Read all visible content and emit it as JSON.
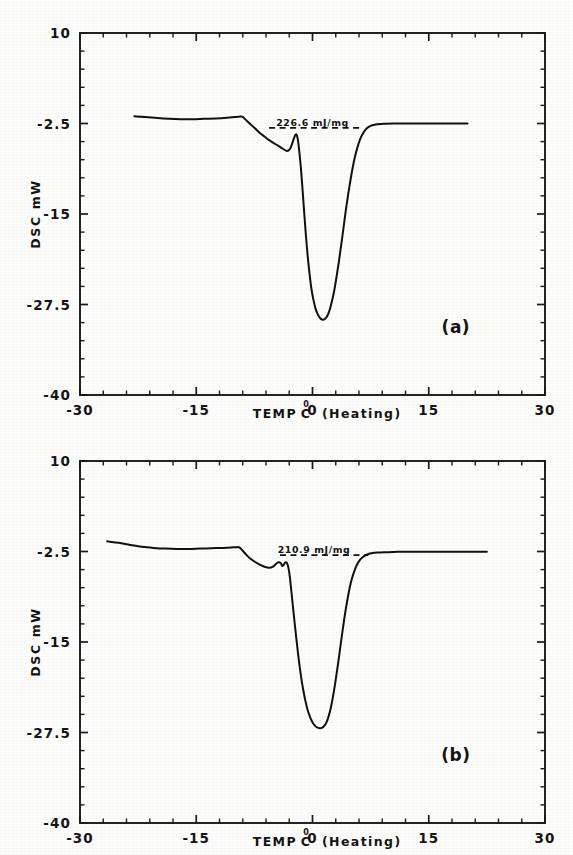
{
  "figure": {
    "background_color": "#fdfdfc",
    "ink_color": "#141414",
    "panel_count": 2
  },
  "chart_data": [
    {
      "type": "line",
      "panel_tag": "(a)",
      "title": "",
      "xlabel": "TEMP C  (Heating)",
      "xlabel_parts": {
        "prefix": "TEMP",
        "degree": "0",
        "unit": "C",
        "suffix": "(Heating)"
      },
      "ylabel": "DSC mW",
      "xlim": [
        -30,
        30
      ],
      "ylim": [
        -40,
        10
      ],
      "xticks": [
        -30,
        -15,
        0,
        15,
        30
      ],
      "xticklabels": [
        "-30",
        "-15",
        "0",
        "15",
        "30"
      ],
      "yticks": [
        10,
        -2.5,
        -15,
        -27.5,
        -40
      ],
      "yticklabels": [
        "10",
        "-2.5",
        "-15",
        "-27.5",
        "-40"
      ],
      "grid": false,
      "legend": "none",
      "annotations": [
        {
          "text": "226.6 mJ/mg",
          "kind": "enthalpy-label",
          "x": 0.0,
          "y": -2.9
        },
        {
          "text": "(a)",
          "kind": "panel-tag",
          "x": 18.5,
          "y": -31.5
        }
      ],
      "baseline": {
        "style": "dashed",
        "x_start": -5.6,
        "x_end": 6.4,
        "y": -3.1
      },
      "series": [
        {
          "name": "DSC heating scan (a)",
          "points": [
            [
              -23.0,
              -1.5
            ],
            [
              -21.5,
              -1.6
            ],
            [
              -20.0,
              -1.75
            ],
            [
              -18.5,
              -1.85
            ],
            [
              -17.0,
              -1.9
            ],
            [
              -15.5,
              -1.9
            ],
            [
              -14.0,
              -1.85
            ],
            [
              -12.5,
              -1.8
            ],
            [
              -11.0,
              -1.7
            ],
            [
              -10.0,
              -1.6
            ],
            [
              -9.3,
              -1.55
            ],
            [
              -9.0,
              -1.6
            ],
            [
              -8.6,
              -2.0
            ],
            [
              -8.0,
              -2.6
            ],
            [
              -7.4,
              -3.2
            ],
            [
              -6.8,
              -3.8
            ],
            [
              -6.2,
              -4.3
            ],
            [
              -5.6,
              -4.8
            ],
            [
              -5.0,
              -5.2
            ],
            [
              -4.4,
              -5.6
            ],
            [
              -3.8,
              -6.0
            ],
            [
              -3.3,
              -6.3
            ],
            [
              -2.9,
              -6.0
            ],
            [
              -2.6,
              -5.2
            ],
            [
              -2.35,
              -4.4
            ],
            [
              -2.15,
              -4.0
            ],
            [
              -2.0,
              -4.2
            ],
            [
              -1.85,
              -5.0
            ],
            [
              -1.7,
              -6.4
            ],
            [
              -1.5,
              -8.6
            ],
            [
              -1.3,
              -11.4
            ],
            [
              -1.1,
              -14.4
            ],
            [
              -0.9,
              -17.3
            ],
            [
              -0.7,
              -19.9
            ],
            [
              -0.5,
              -22.1
            ],
            [
              -0.3,
              -24.0
            ],
            [
              -0.1,
              -25.6
            ],
            [
              0.15,
              -27.0
            ],
            [
              0.4,
              -28.1
            ],
            [
              0.7,
              -28.9
            ],
            [
              1.0,
              -29.4
            ],
            [
              1.3,
              -29.6
            ],
            [
              1.6,
              -29.5
            ],
            [
              1.9,
              -29.1
            ],
            [
              2.2,
              -28.3
            ],
            [
              2.5,
              -27.1
            ],
            [
              2.8,
              -25.6
            ],
            [
              3.1,
              -23.7
            ],
            [
              3.4,
              -21.6
            ],
            [
              3.7,
              -19.3
            ],
            [
              4.0,
              -16.9
            ],
            [
              4.3,
              -14.5
            ],
            [
              4.6,
              -12.3
            ],
            [
              4.9,
              -10.3
            ],
            [
              5.2,
              -8.5
            ],
            [
              5.5,
              -7.0
            ],
            [
              5.8,
              -5.8
            ],
            [
              6.1,
              -4.8
            ],
            [
              6.4,
              -4.1
            ],
            [
              6.8,
              -3.4
            ],
            [
              7.2,
              -3.0
            ],
            [
              7.7,
              -2.75
            ],
            [
              8.3,
              -2.6
            ],
            [
              9.2,
              -2.55
            ],
            [
              10.5,
              -2.5
            ],
            [
              12.5,
              -2.5
            ],
            [
              14.5,
              -2.5
            ],
            [
              16.5,
              -2.5
            ],
            [
              18.5,
              -2.5
            ],
            [
              20.0,
              -2.5
            ]
          ]
        }
      ]
    },
    {
      "type": "line",
      "panel_tag": "(b)",
      "title": "",
      "xlabel": "TEMP C  (Heating)",
      "xlabel_parts": {
        "prefix": "TEMP",
        "degree": "0",
        "unit": "C",
        "suffix": "(Heating)"
      },
      "ylabel": "DSC mW",
      "xlim": [
        -30,
        30
      ],
      "ylim": [
        -40,
        10
      ],
      "xticks": [
        -30,
        -15,
        0,
        15,
        30
      ],
      "xticklabels": [
        "-30",
        "-15",
        "0",
        "15",
        "30"
      ],
      "yticks": [
        10,
        -2.5,
        -15,
        -27.5,
        -40
      ],
      "yticklabels": [
        "10",
        "-2.5",
        "-15",
        "-27.5",
        "-40"
      ],
      "grid": false,
      "legend": "none",
      "annotations": [
        {
          "text": "210.9 mJ/mg",
          "kind": "enthalpy-label",
          "x": 0.2,
          "y": -2.7
        },
        {
          "text": "(b)",
          "kind": "panel-tag",
          "x": 18.5,
          "y": -31.5
        }
      ],
      "baseline": {
        "style": "dashed",
        "x_start": -4.2,
        "x_end": 7.2,
        "y": -3.0
      },
      "series": [
        {
          "name": "DSC heating scan (b)",
          "points": [
            [
              -26.5,
              -1.1
            ],
            [
              -25.0,
              -1.3
            ],
            [
              -23.5,
              -1.6
            ],
            [
              -22.0,
              -1.85
            ],
            [
              -20.5,
              -2.0
            ],
            [
              -19.0,
              -2.1
            ],
            [
              -17.5,
              -2.15
            ],
            [
              -16.0,
              -2.15
            ],
            [
              -14.5,
              -2.1
            ],
            [
              -13.0,
              -2.05
            ],
            [
              -11.5,
              -2.0
            ],
            [
              -10.5,
              -1.95
            ],
            [
              -9.8,
              -1.9
            ],
            [
              -9.4,
              -1.95
            ],
            [
              -9.0,
              -2.4
            ],
            [
              -8.5,
              -3.0
            ],
            [
              -8.0,
              -3.5
            ],
            [
              -7.4,
              -3.95
            ],
            [
              -6.8,
              -4.3
            ],
            [
              -6.2,
              -4.6
            ],
            [
              -5.6,
              -4.75
            ],
            [
              -5.1,
              -4.6
            ],
            [
              -4.7,
              -4.2
            ],
            [
              -4.4,
              -4.0
            ],
            [
              -4.1,
              -4.1
            ],
            [
              -3.9,
              -4.5
            ],
            [
              -3.7,
              -4.3
            ],
            [
              -3.5,
              -4.0
            ],
            [
              -3.3,
              -4.1
            ],
            [
              -3.1,
              -4.8
            ],
            [
              -2.9,
              -6.2
            ],
            [
              -2.7,
              -8.3
            ],
            [
              -2.4,
              -11.4
            ],
            [
              -2.1,
              -14.4
            ],
            [
              -1.8,
              -17.2
            ],
            [
              -1.5,
              -19.6
            ],
            [
              -1.2,
              -21.6
            ],
            [
              -0.9,
              -23.2
            ],
            [
              -0.6,
              -24.5
            ],
            [
              -0.3,
              -25.4
            ],
            [
              0.0,
              -26.1
            ],
            [
              0.3,
              -26.55
            ],
            [
              0.6,
              -26.8
            ],
            [
              0.9,
              -26.9
            ],
            [
              1.2,
              -26.85
            ],
            [
              1.5,
              -26.6
            ],
            [
              1.8,
              -26.1
            ],
            [
              2.1,
              -25.2
            ],
            [
              2.4,
              -23.9
            ],
            [
              2.7,
              -22.2
            ],
            [
              3.0,
              -20.2
            ],
            [
              3.3,
              -18.0
            ],
            [
              3.6,
              -15.6
            ],
            [
              3.9,
              -13.3
            ],
            [
              4.2,
              -11.1
            ],
            [
              4.5,
              -9.2
            ],
            [
              4.8,
              -7.5
            ],
            [
              5.1,
              -6.2
            ],
            [
              5.4,
              -5.2
            ],
            [
              5.7,
              -4.4
            ],
            [
              6.1,
              -3.7
            ],
            [
              6.5,
              -3.25
            ],
            [
              7.0,
              -2.95
            ],
            [
              7.6,
              -2.75
            ],
            [
              8.4,
              -2.65
            ],
            [
              9.5,
              -2.6
            ],
            [
              11.0,
              -2.55
            ],
            [
              13.0,
              -2.55
            ],
            [
              15.5,
              -2.55
            ],
            [
              18.0,
              -2.55
            ],
            [
              20.5,
              -2.55
            ],
            [
              22.5,
              -2.55
            ]
          ]
        }
      ]
    }
  ]
}
